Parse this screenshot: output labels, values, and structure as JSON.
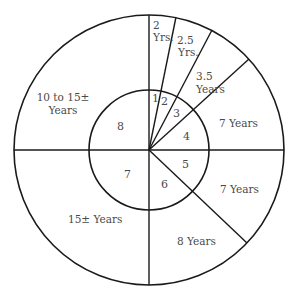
{
  "diagram": {
    "title": "",
    "center": [
      149,
      150
    ],
    "outer_radius": 135,
    "inner_radius": 60,
    "colors": {
      "line": "#1a1a1a",
      "text": "#4a4a4a",
      "background": "#ffffff"
    },
    "outer_labels": {
      "seg1": {
        "line1": "2",
        "line2": "Yrs."
      },
      "seg2": {
        "line1": "2.5",
        "line2": "Yrs."
      },
      "seg3": {
        "line1": "3.5",
        "line2": "Years"
      },
      "seg4": {
        "line1": "7 Years"
      },
      "seg5": {
        "line1": "7 Years"
      },
      "seg6": {
        "line1": "8 Years"
      },
      "seg7": {
        "line1": "15± Years"
      },
      "seg8": {
        "line1": "10 to 15±",
        "line2": "Years"
      }
    },
    "inner_labels": {
      "seg1": "1",
      "seg2": "2",
      "seg3": "3",
      "seg4": "4",
      "seg5": "5",
      "seg6": "6",
      "seg7": "7",
      "seg8": "8"
    }
  }
}
